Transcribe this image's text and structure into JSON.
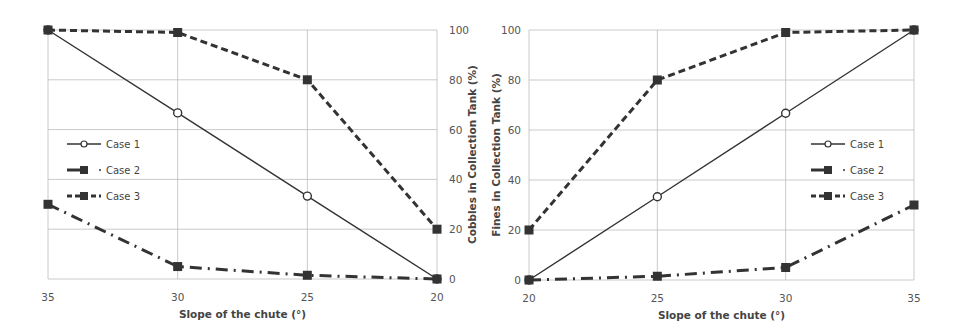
{
  "chart_data": [
    {
      "type": "line",
      "title": "",
      "xlabel": "Slope of the chute (°)",
      "ylabel": "Cobbles in Collection Tank (%)",
      "ylabel_position": "right",
      "x": [
        35,
        30,
        25,
        20
      ],
      "x_ticks": [
        "35",
        "30",
        "25",
        "20"
      ],
      "y_ticks": [
        "0",
        "20",
        "40",
        "60",
        "80",
        "100"
      ],
      "ylim": [
        0,
        100
      ],
      "grid": true,
      "legend_position": "center-left",
      "series": [
        {
          "name": "Case 1",
          "style": "solid",
          "marker": "open-diamond",
          "values": [
            100,
            66.7,
            33.3,
            0
          ]
        },
        {
          "name": "Case 2",
          "style": "dash-dot",
          "marker": "square",
          "values": [
            30,
            5,
            1.5,
            0
          ]
        },
        {
          "name": "Case 3",
          "style": "dashed",
          "marker": "square",
          "values": [
            100,
            99,
            80,
            20
          ]
        }
      ]
    },
    {
      "type": "line",
      "title": "",
      "xlabel": "Slope of the chute (°)",
      "ylabel": "Fines in Collection Tank (%)",
      "ylabel_position": "left",
      "x": [
        20,
        25,
        30,
        35
      ],
      "x_ticks": [
        "20",
        "25",
        "30",
        "35"
      ],
      "y_ticks": [
        "0",
        "20",
        "40",
        "60",
        "80",
        "100"
      ],
      "ylim": [
        0,
        100
      ],
      "grid": true,
      "legend_position": "center-right",
      "series": [
        {
          "name": "Case 1",
          "style": "solid",
          "marker": "open-diamond",
          "values": [
            0,
            33.3,
            66.7,
            100
          ]
        },
        {
          "name": "Case 2",
          "style": "dash-dot",
          "marker": "square",
          "values": [
            0,
            1.5,
            5,
            30
          ]
        },
        {
          "name": "Case 3",
          "style": "dashed",
          "marker": "square",
          "values": [
            20,
            80,
            99,
            100
          ]
        }
      ]
    }
  ],
  "colors": {
    "line": "#333333",
    "grid": "#bdbdbd",
    "text": "#555555"
  }
}
